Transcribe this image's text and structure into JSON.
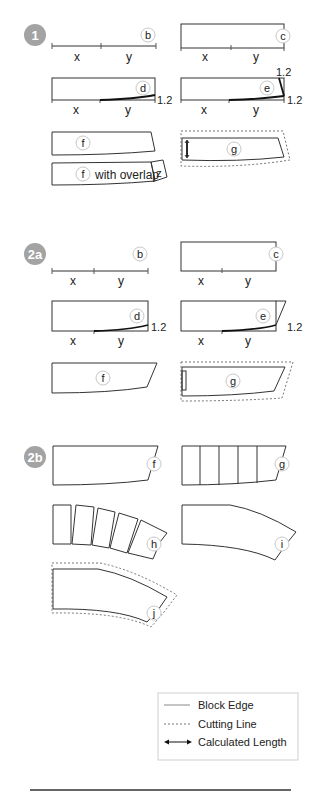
{
  "sections": [
    {
      "id": "1",
      "badge": "1"
    },
    {
      "id": "2a",
      "badge": "2a"
    },
    {
      "id": "2b",
      "badge": "2b"
    }
  ],
  "labels": {
    "b": "b",
    "c": "c",
    "d": "d",
    "e": "e",
    "f": "f",
    "g": "g",
    "h": "h",
    "i": "i",
    "j": "j",
    "z": "z",
    "x": "x",
    "y": "y",
    "measure": "1.2",
    "with_overlap": "with overlap"
  },
  "legend": {
    "items": [
      {
        "style": "solid",
        "label": "Block Edge"
      },
      {
        "style": "dashed",
        "label": "Cutting Line"
      },
      {
        "style": "arrow",
        "label": "Calculated Length"
      }
    ]
  },
  "colors": {
    "badge": "#a3a3a3",
    "line": "#333333",
    "bold": "#111111",
    "cut": "#666666"
  }
}
